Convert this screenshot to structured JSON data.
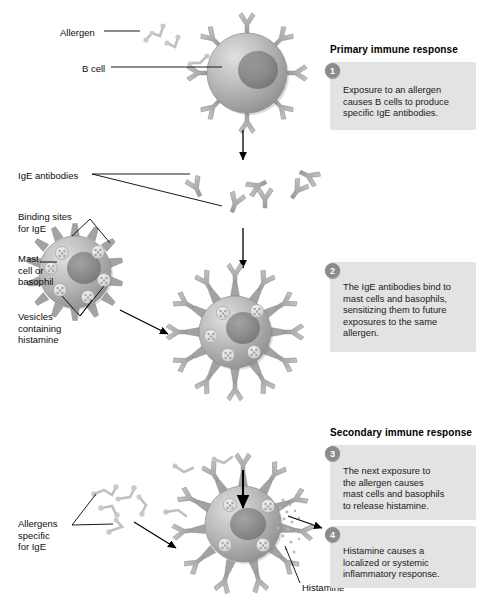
{
  "figure": {
    "title_hidden": "Allergic response: primary and secondary immune response to an allergen"
  },
  "labels": [
    {
      "id": "allergen",
      "text": "Allergen",
      "x": 60,
      "y": 27
    },
    {
      "id": "b-cell",
      "text": "B cell",
      "x": 82,
      "y": 63
    },
    {
      "id": "ige-antibodies",
      "text": "IgE antibodies",
      "x": 18,
      "y": 170
    },
    {
      "id": "binding-sites",
      "text": "Binding sites\nfor IgE",
      "x": 18,
      "y": 211
    },
    {
      "id": "mast-cell",
      "text": "Mast\ncell or\nbasophil",
      "x": 18,
      "y": 253
    },
    {
      "id": "vesicles",
      "text": "Vesicles\ncontaining\nhistamine",
      "x": 18,
      "y": 311
    },
    {
      "id": "allergens-specific",
      "text": "Allergens\nspecific\nfor IgE",
      "x": 18,
      "y": 518
    },
    {
      "id": "histamine",
      "text": "Histamine",
      "x": 302,
      "y": 582
    }
  ],
  "sections": [
    {
      "id": "primary",
      "heading": "Primary immune response",
      "x": 330,
      "y": 44
    },
    {
      "id": "secondary",
      "heading": "Secondary immune response",
      "x": 330,
      "y": 427
    }
  ],
  "steps": [
    {
      "number": "1",
      "text": "Exposure to an allergen\ncauses B cells to produce\nspecific IgE antibodies.",
      "box": {
        "x": 330,
        "y": 62,
        "w": 146,
        "h": 68
      },
      "badge": {
        "x": 325,
        "y": 63
      },
      "text_pos": {
        "x": 343,
        "y": 85
      }
    },
    {
      "number": "2",
      "text": "The IgE antibodies bind to\nmast cells and basophils,\nsensitizing them to future\nexposures to the same\nallergen.",
      "box": {
        "x": 330,
        "y": 262,
        "w": 146,
        "h": 90
      },
      "badge": {
        "x": 325,
        "y": 263
      },
      "text_pos": {
        "x": 343,
        "y": 282
      }
    },
    {
      "number": "3",
      "text": "The next exposure to\nthe allergen causes\nmast cells and basophils\nto release histamine.",
      "box": {
        "x": 330,
        "y": 445,
        "w": 146,
        "h": 75
      },
      "badge": {
        "x": 325,
        "y": 446
      },
      "text_pos": {
        "x": 343,
        "y": 466
      }
    },
    {
      "number": "4",
      "text": "Histamine causes a\nlocalized or systemic\ninflammatory response.",
      "box": {
        "x": 330,
        "y": 526,
        "w": 146,
        "h": 62
      },
      "badge": {
        "x": 325,
        "y": 527
      },
      "text_pos": {
        "x": 343,
        "y": 546
      }
    }
  ],
  "colors": {
    "cell_body": "#a9a9a9",
    "cell_nucleus": "#7d7d7d",
    "receptor": "#a8a8a8",
    "antibody": "#b0b0b0",
    "allergen": "#c2c2c2",
    "vesicle": "#e6e6e6",
    "box_background": "#e3e3e3",
    "badge_background": "#8b8b8b",
    "leader_line": "#000000",
    "arrow": "#000000"
  },
  "diagram_elements": {
    "b_cell": {
      "cx": 247,
      "cy": 73,
      "r": 40,
      "receptor_count": 8
    },
    "free_antibodies": {
      "count": 6,
      "region": "y 165-215"
    },
    "resting_mast_cell": {
      "cx": 75,
      "cy": 272,
      "r": 36,
      "spike_count": 14,
      "vesicle_count": 6
    },
    "sensitized_mast_cell": {
      "cx": 235,
      "cy": 332,
      "r": 36,
      "receptor_count": 12,
      "vesicle_count": 6
    },
    "degranulating_mast_cell": {
      "cx": 243,
      "cy": 524,
      "r": 38,
      "receptor_count": 11,
      "vesicle_count": 5
    },
    "flow_arrows": [
      "b-cell to antibodies",
      "antibodies to mast cell",
      "mast cell to sensitized cell",
      "allergen into mast cell",
      "histamine out of mast cell"
    ]
  }
}
